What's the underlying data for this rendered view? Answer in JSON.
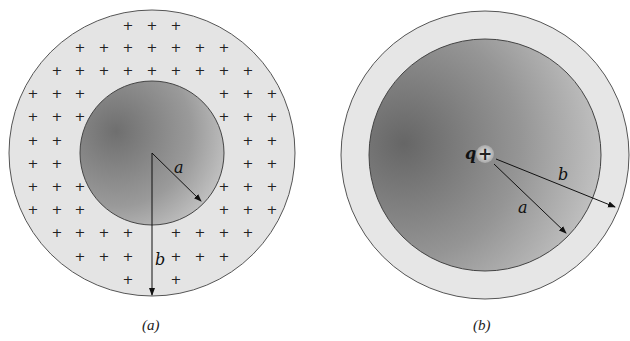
{
  "figure_a": {
    "caption": "(a)",
    "inner_radius_label": "a",
    "outer_radius_label": "b",
    "charge_symbol": "+",
    "description": "Charged spherical shell (uniform + charge between radii a and b) around an uncharged cavity",
    "colors": {
      "shell": "#e3e3e3",
      "cavity_dark": "#6f6f6f",
      "cavity_light": "#d0d0d0",
      "outline": "#444444"
    }
  },
  "figure_b": {
    "caption": "(b)",
    "charge_label": "q",
    "charge_symbol": "+",
    "inner_radius_label": "a",
    "outer_radius_label": "b",
    "description": "Point charge q at center of conducting sphere of radius a inside shell of radius b",
    "colors": {
      "shell": "#e3e3e3",
      "core_dark": "#6a6a6a",
      "core_light": "#cfcfcf",
      "outline": "#444444"
    }
  }
}
